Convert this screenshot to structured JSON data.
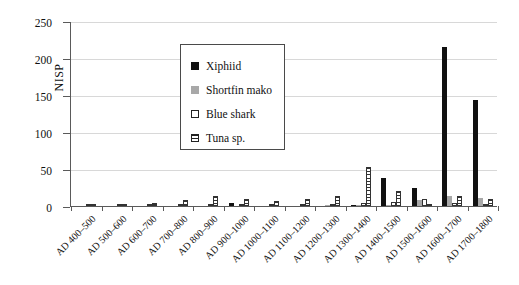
{
  "chart_data": {
    "type": "bar",
    "title": "",
    "xlabel": "",
    "ylabel": "NISP",
    "ylim": [
      0,
      250
    ],
    "ytick_values": [
      0,
      50,
      100,
      150,
      200,
      250
    ],
    "ytick_labels": [
      "0",
      "50",
      "100",
      "150",
      "200",
      "250"
    ],
    "grid": true,
    "legend_position": "upper-left-inside",
    "categories": [
      "AD 400–500",
      "AD 500–600",
      "AD 600–700",
      "AD 700–800",
      "AD 800–900",
      "AD 900–1000",
      "AD 1000–1100",
      "AD 1100–1200",
      "AD 1200–1300",
      "AD 1300–1400",
      "AD 1400–1500",
      "AD 1500–1600",
      "AD 1600–1700",
      "AD 1700–1800"
    ],
    "series": [
      {
        "name": "Xiphiid",
        "color": "#111111",
        "values": [
          0,
          0,
          0,
          0,
          0,
          4,
          0,
          0,
          0,
          1,
          38,
          25,
          215,
          143
        ]
      },
      {
        "name": "Shortfin mako",
        "color": "#a8a8a8",
        "values": [
          0,
          0,
          0,
          0,
          0,
          0,
          0,
          0,
          1,
          2,
          2,
          8,
          14,
          11
        ]
      },
      {
        "name": "Blue shark",
        "color": "#ffffff",
        "values": [
          0,
          0,
          0,
          1,
          0,
          0,
          0,
          1,
          1,
          4,
          6,
          9,
          4,
          3
        ]
      },
      {
        "name": "Tuna sp.",
        "color": "#ffffff-hatched",
        "values": [
          1,
          2,
          4,
          8,
          14,
          9,
          7,
          9,
          13,
          53,
          20,
          2,
          13,
          10
        ]
      }
    ]
  },
  "legend": {
    "items": [
      {
        "label": "Xiphiid",
        "swatch": "xiphiid"
      },
      {
        "label": "Shortfin mako",
        "swatch": "mako"
      },
      {
        "label": "Blue shark",
        "swatch": "blue"
      },
      {
        "label": "Tuna sp.",
        "swatch": "tuna"
      }
    ]
  }
}
